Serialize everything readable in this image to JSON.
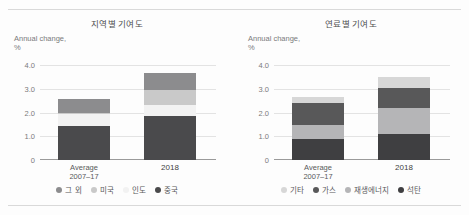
{
  "figure": {
    "background": "#fdfdfd",
    "rule_color": "#d9d9d9"
  },
  "chart_data": [
    {
      "type": "bar",
      "stacked": true,
      "title": "지역별 기여도",
      "xlabel": "",
      "ylabel": "Annual change,\n%",
      "ylim": [
        0,
        4.0
      ],
      "yticks": [
        "0",
        "1.0",
        "2.0",
        "3.0",
        "4.0"
      ],
      "ytick_values": [
        0,
        1.0,
        2.0,
        3.0,
        4.0
      ],
      "grid": true,
      "legend_position": "bottom",
      "categories": [
        "Average\n2007–17",
        "2018"
      ],
      "category_labels": [
        "Average",
        "2007–17",
        "2018"
      ],
      "series": [
        {
          "name": "중국",
          "color": "#4a4a4c",
          "values": [
            1.45,
            1.85
          ]
        },
        {
          "name": "인도",
          "color": "#f2f2f2",
          "values": [
            0.5,
            0.45
          ]
        },
        {
          "name": "미국",
          "color": "#c9c9c9",
          "values": [
            0.02,
            0.65
          ]
        },
        {
          "name": "그 외",
          "color": "#8c8c8e",
          "values": [
            0.58,
            0.7
          ]
        }
      ],
      "totals": [
        2.55,
        3.65
      ],
      "legend": [
        {
          "label": "그 외",
          "color": "#8c8c8e"
        },
        {
          "label": "미국",
          "color": "#c9c9c9"
        },
        {
          "label": "인도",
          "color": "#f2f2f2"
        },
        {
          "label": "중국",
          "color": "#4a4a4c"
        }
      ]
    },
    {
      "type": "bar",
      "stacked": true,
      "title": "연료별 기여도",
      "xlabel": "",
      "ylabel": "Annual change,\n%",
      "ylim": [
        0,
        4.0
      ],
      "yticks": [
        "0",
        "1.0",
        "2.0",
        "3.0",
        "4.0"
      ],
      "ytick_values": [
        0,
        1.0,
        2.0,
        3.0,
        4.0
      ],
      "grid": true,
      "legend_position": "bottom",
      "categories": [
        "Average\n2007–17",
        "2018"
      ],
      "category_labels": [
        "Average",
        "2007–17",
        "2018"
      ],
      "series": [
        {
          "name": "석탄",
          "color": "#3f3f41",
          "values": [
            0.88,
            1.1
          ]
        },
        {
          "name": "재생에너지",
          "color": "#b5b5b7",
          "values": [
            0.6,
            1.1
          ]
        },
        {
          "name": "가스",
          "color": "#585859",
          "values": [
            0.9,
            0.85
          ]
        },
        {
          "name": "기타",
          "color": "#d7d7d7",
          "values": [
            0.28,
            0.45
          ]
        }
      ],
      "totals": [
        2.66,
        3.5
      ],
      "legend": [
        {
          "label": "기타",
          "color": "#d7d7d7"
        },
        {
          "label": "가스",
          "color": "#585859"
        },
        {
          "label": "재생에너지",
          "color": "#b5b5b7"
        },
        {
          "label": "석탄",
          "color": "#3f3f41"
        }
      ]
    }
  ]
}
